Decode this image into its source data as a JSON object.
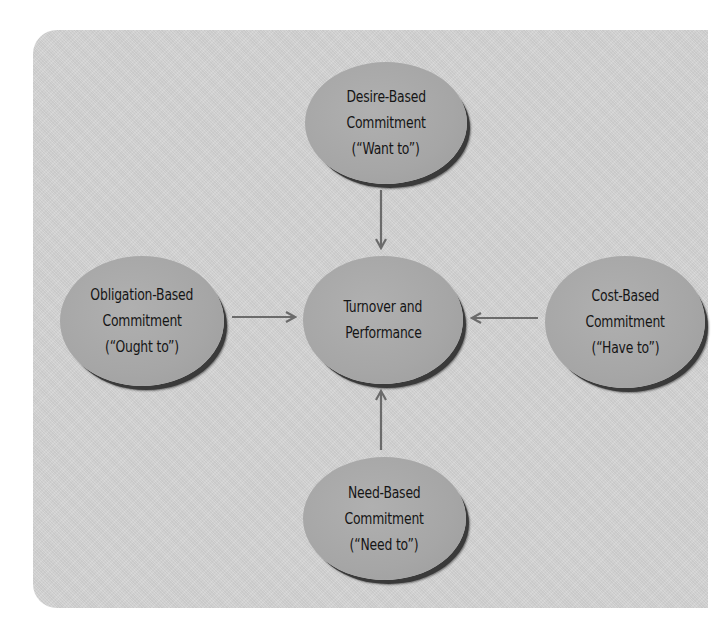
{
  "diagram": {
    "type": "hub-and-spoke",
    "colors": {
      "panel_background": "#d4d4d4",
      "node_fill": "#a8a8a8",
      "node_shadow": "#3a3a3a",
      "text": "#151515",
      "arrow": "#6b6b6b"
    },
    "center": {
      "id": "turnover-performance",
      "lines": [
        "Turnover and",
        "Performance"
      ]
    },
    "nodes": {
      "desire": {
        "position": "top",
        "lines": [
          "Desire-Based",
          "Commitment",
          "(“Want to”)"
        ]
      },
      "obligation": {
        "position": "left",
        "lines": [
          "Obligation-Based",
          "Commitment",
          "(“Ought to”)"
        ]
      },
      "cost": {
        "position": "right",
        "lines": [
          "Cost-Based",
          "Commitment",
          "(“Have to”)"
        ]
      },
      "need": {
        "position": "bottom",
        "lines": [
          "Need-Based",
          "Commitment",
          "(“Need to”)"
        ]
      }
    },
    "edges": [
      {
        "from": "desire",
        "to": "turnover-performance",
        "direction": "down"
      },
      {
        "from": "obligation",
        "to": "turnover-performance",
        "direction": "right"
      },
      {
        "from": "cost",
        "to": "turnover-performance",
        "direction": "left"
      },
      {
        "from": "need",
        "to": "turnover-performance",
        "direction": "up"
      }
    ]
  }
}
